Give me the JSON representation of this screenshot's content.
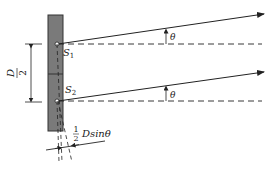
{
  "diagram": {
    "colors": {
      "panel_fill": "#7a7a7a",
      "panel_stroke": "#333333",
      "line": "#222222",
      "background": "#ffffff"
    },
    "labels": {
      "s1": "S",
      "s1_sub": "1",
      "s2": "S",
      "s2_sub": "2",
      "theta_top": "θ",
      "theta_bottom": "θ",
      "half_D_num": "D",
      "half_D_den": "2",
      "path_diff_frac_num": "1",
      "path_diff_frac_den": "2",
      "path_diff_text": "Dsinθ"
    },
    "elements": [
      "screen panel with two sources S1 and S2",
      "dimension line D/2 between S1 and S2",
      "ray from S1 at angle θ above horizontal dashed reference",
      "ray from S2 at angle θ above horizontal dashed reference",
      "dashed perpendicular construction lines",
      "path difference ½ D sinθ"
    ]
  }
}
